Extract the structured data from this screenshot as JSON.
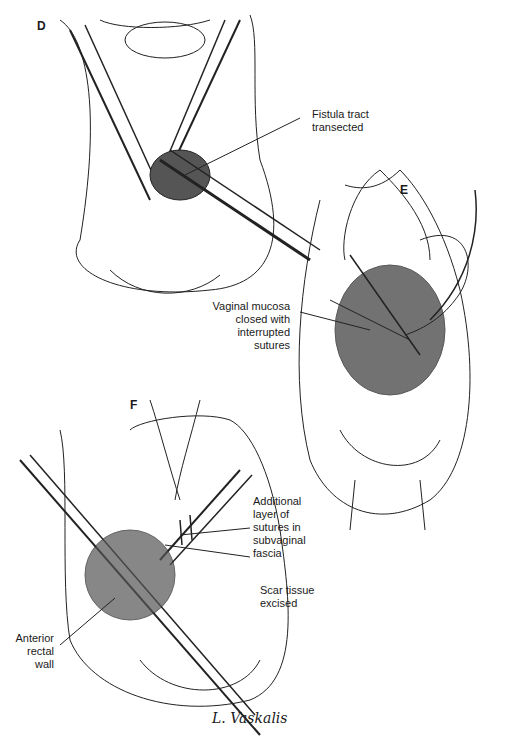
{
  "panels": [
    {
      "letter": "D",
      "labels": [
        {
          "text": [
            "Fistula tract",
            "transected"
          ]
        }
      ]
    },
    {
      "letter": "E",
      "labels": [
        {
          "text": [
            "Vaginal mucosa",
            "closed with",
            "interrupted",
            "sutures"
          ]
        }
      ]
    },
    {
      "letter": "F",
      "labels": [
        {
          "text": [
            "Additional",
            "layer of",
            "sutures in",
            "subvaginal",
            "fascia"
          ]
        },
        {
          "text": [
            "Scar tissue",
            "excised"
          ]
        },
        {
          "text": [
            "Anterior",
            "rectal",
            "wall"
          ]
        }
      ]
    }
  ],
  "signature": "L. Vaskalis"
}
